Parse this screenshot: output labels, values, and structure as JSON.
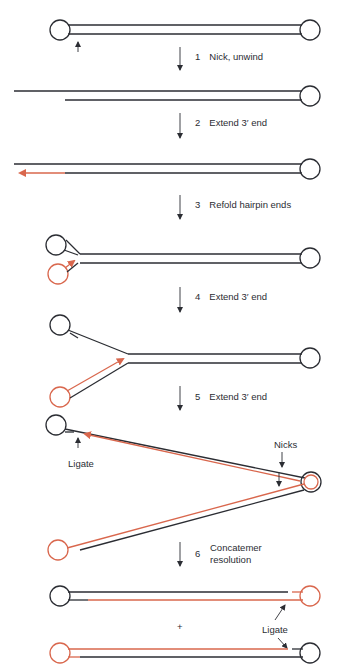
{
  "diagram": {
    "type": "dna-replication-hairpin-concatemer",
    "colors": {
      "parental_strand": "#2b2d33",
      "new_strand": "#d9674d"
    },
    "steps": [
      {
        "num": "1",
        "label": "Nick, unwind"
      },
      {
        "num": "2",
        "label": "Extend 3′ end"
      },
      {
        "num": "3",
        "label": "Refold hairpin ends"
      },
      {
        "num": "4",
        "label": "Extend 3′ end"
      },
      {
        "num": "5",
        "label": "Extend 3′ end"
      },
      {
        "num": "6",
        "label_line1": "Concatemer",
        "label_line2": "resolution"
      }
    ],
    "annotations": {
      "ligate_step5": "Ligate",
      "nicks": "Nicks",
      "ligate_final": "Ligate",
      "plus": "+"
    }
  }
}
